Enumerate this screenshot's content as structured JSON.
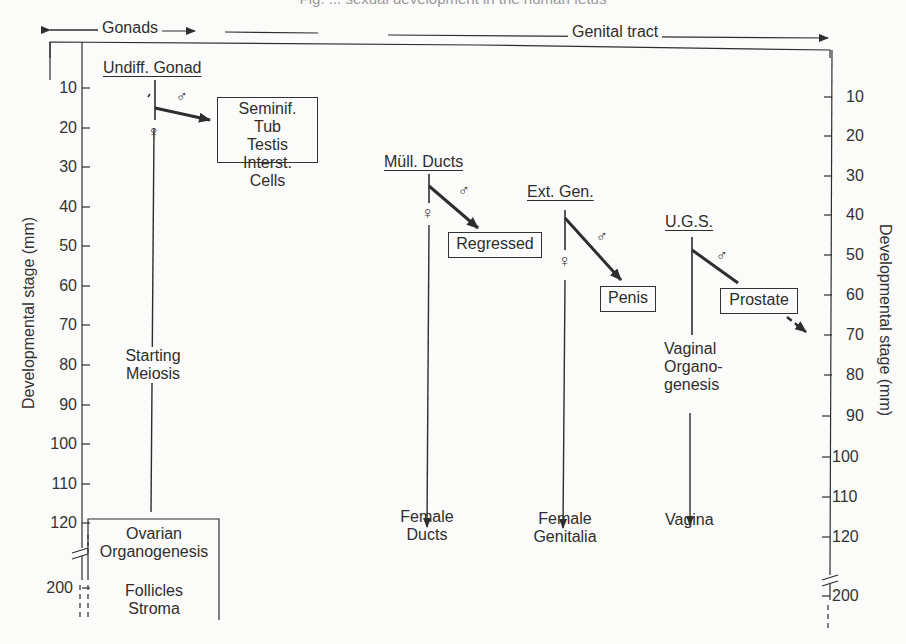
{
  "caption": "Fig. ... sexual development in the human fetus",
  "header": {
    "left_span": "Gonads",
    "right_span": "Genital tract"
  },
  "axes": {
    "left_label": "Developmental stage (mm)",
    "right_label": "Developmental stage (mm)",
    "ticks": [
      "10",
      "20",
      "30",
      "40",
      "50",
      "60",
      "70",
      "80",
      "90",
      "100",
      "110",
      "120",
      "200"
    ]
  },
  "columns": {
    "gonad": {
      "title": "Undiff. Gonad",
      "male_symbol": "♂",
      "female_symbol": "♀",
      "male_outcome": [
        "Seminif. Tub",
        "Testis",
        "Interst. Cells"
      ],
      "female_mid": [
        "Starting",
        "Meiosis"
      ],
      "female_outcome_1": [
        "Ovarian",
        "Organogenesis"
      ],
      "female_outcome_2": [
        "Follicles",
        "Stroma"
      ]
    },
    "mullerian": {
      "title": "Müll. Ducts",
      "male_symbol": "♂",
      "female_symbol": "♀",
      "male_outcome": "Regressed",
      "female_outcome": [
        "Female",
        "Ducts"
      ]
    },
    "external": {
      "title": "Ext. Gen.",
      "male_symbol": "♂",
      "female_symbol": "♀",
      "male_outcome": "Penis",
      "female_outcome": [
        "Female",
        "Genitalia"
      ]
    },
    "ugs": {
      "title": "U.G.S.",
      "male_symbol": "♂",
      "male_outcome": "Prostate",
      "female_mid": [
        "Vaginal",
        "Organo-",
        "genesis"
      ],
      "female_outcome": "Vagina"
    }
  },
  "colors": {
    "ink": "#2e2e2e",
    "paper": "#fbfbfa"
  }
}
